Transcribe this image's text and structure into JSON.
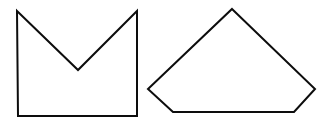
{
  "canvas": {
    "width": 329,
    "height": 129,
    "background_color": "#ffffff",
    "description": "Two black outlined geometric shapes on a plain white background"
  },
  "style": {
    "stroke_color": "#0d0d0d",
    "fill_color": "#ffffff",
    "stroke_width": 2
  },
  "shapes": [
    {
      "id": "crown-polygon",
      "name": "notched-square-crown",
      "label": "Concave hexagon: square with V-notch cut into top edge",
      "vertex_count": 6,
      "concave": true,
      "points": "17,11 78,70 137,11 137,116 18,116 17,11",
      "vertices": [
        {
          "name": "top-left-peak",
          "x": 17,
          "y": 11
        },
        {
          "name": "notch-valley",
          "x": 78,
          "y": 70
        },
        {
          "name": "top-right-peak",
          "x": 137,
          "y": 11
        },
        {
          "name": "bottom-right",
          "x": 137,
          "y": 116
        },
        {
          "name": "bottom-left",
          "x": 18,
          "y": 116
        }
      ]
    },
    {
      "id": "pentagon-polygon",
      "name": "house-pentagon",
      "label": "Convex pentagon with top apex, wide base",
      "vertex_count": 5,
      "concave": false,
      "points": "232,9 315,89 294,112 173,112 148,89 232,9",
      "vertices": [
        {
          "name": "top-apex",
          "x": 232,
          "y": 9
        },
        {
          "name": "right-vertex",
          "x": 315,
          "y": 89
        },
        {
          "name": "bottom-right",
          "x": 294,
          "y": 112
        },
        {
          "name": "bottom-left",
          "x": 173,
          "y": 112
        },
        {
          "name": "left-vertex",
          "x": 148,
          "y": 89
        }
      ]
    }
  ]
}
